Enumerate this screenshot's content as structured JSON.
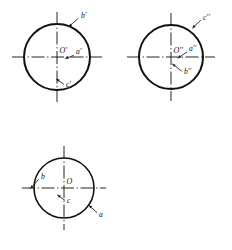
{
  "figure": {
    "type": "engineering-drawing",
    "background_color": "#ffffff",
    "line_color": "#111111",
    "centerline_color": "#1a1a1a"
  },
  "views": [
    {
      "id": "front-view",
      "name": "front-view",
      "position": "top-left",
      "center": {
        "x": 57,
        "y": 57
      },
      "radius": 33,
      "stroke_width": 2.0,
      "origin_label": "O'",
      "points": [
        {
          "name": "a-prime",
          "label": "a'",
          "label_x": 76,
          "label_y": 52,
          "leader": {
            "x1": 73.5,
            "y1": 55.5,
            "x2": 65.5,
            "y2": 58.5
          }
        },
        {
          "name": "b-prime",
          "label": "b'",
          "label_x": 81,
          "label_y": 16,
          "leader": {
            "x1": 78.0,
            "y1": 18.5,
            "x2": 69.0,
            "y2": 26.5
          }
        },
        {
          "name": "c-prime",
          "label": "c'",
          "label_x": 66,
          "label_y": 85,
          "leader": {
            "x1": 63.5,
            "y1": 84.0,
            "x2": 56.5,
            "y2": 79.0
          }
        }
      ]
    },
    {
      "id": "side-view",
      "name": "side-view",
      "position": "top-right",
      "center": {
        "x": 171,
        "y": 57
      },
      "radius": 32,
      "stroke_width": 2.0,
      "origin_label": "O''",
      "points": [
        {
          "name": "a-double-prime",
          "label": "a''",
          "label_x": 189,
          "label_y": 49,
          "leader": {
            "x1": 187.0,
            "y1": 52.0,
            "x2": 178.0,
            "y2": 58.0
          }
        },
        {
          "name": "b-double-prime",
          "label": "b''",
          "label_x": 184,
          "label_y": 72,
          "leader": {
            "x1": 181.5,
            "y1": 71.0,
            "x2": 172.5,
            "y2": 64.0
          }
        },
        {
          "name": "c-double-prime",
          "label": "c''",
          "label_x": 203,
          "label_y": 18,
          "leader": {
            "x1": 200.5,
            "y1": 20.5,
            "x2": 192.5,
            "y2": 28.0
          }
        }
      ]
    },
    {
      "id": "top-view",
      "name": "top-view",
      "position": "bottom-left",
      "center": {
        "x": 64,
        "y": 188
      },
      "radius": 30,
      "stroke_width": 1.6,
      "origin_label": "O",
      "points": [
        {
          "name": "point-a",
          "label": "a",
          "label_x": 99,
          "label_y": 215,
          "leader": {
            "x1": 97.0,
            "y1": 212.5,
            "x2": 89.0,
            "y2": 205.5
          }
        },
        {
          "name": "point-b",
          "label": "b",
          "label_x": 41,
          "label_y": 177,
          "leader": {
            "x1": 38.5,
            "y1": 179.5,
            "x2": 30.5,
            "y2": 188.5
          }
        },
        {
          "name": "point-c",
          "label": "c",
          "label_x": 67,
          "label_y": 201,
          "leader": {
            "x1": 64.5,
            "y1": 200.0,
            "x2": 57.5,
            "y2": 195.0
          }
        }
      ]
    }
  ]
}
